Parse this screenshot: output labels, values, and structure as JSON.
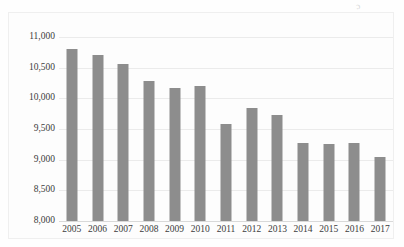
{
  "artifact": {
    "mark": "ɔ"
  },
  "chart_data": {
    "type": "bar",
    "title": "",
    "subtitle": "",
    "xlabel": "",
    "ylabel": "",
    "categories": [
      "2005",
      "2006",
      "2007",
      "2008",
      "2009",
      "2010",
      "2011",
      "2012",
      "2013",
      "2014",
      "2015",
      "2016",
      "2017"
    ],
    "values": [
      10800,
      10700,
      10560,
      10280,
      10170,
      10200,
      9580,
      9840,
      9730,
      9280,
      9250,
      9270,
      9050
    ],
    "series": [
      {
        "name": "",
        "values": [
          10800,
          10700,
          10560,
          10280,
          10170,
          10200,
          9580,
          9840,
          9730,
          9280,
          9250,
          9270,
          9050
        ]
      }
    ],
    "ylim": [
      8000,
      11000
    ],
    "ytick_step": 500,
    "ytick_labels": [
      "11,000",
      "10,500",
      "10,000",
      "9,500",
      "9,000",
      "8,500",
      "8,000"
    ],
    "ytick_values": [
      11000,
      10500,
      10000,
      9500,
      9000,
      8500,
      8000
    ],
    "grid": true,
    "legend": false,
    "legend_position": "none",
    "bar_color": "#8d8d8d",
    "gridline_color": "#ebebeb",
    "axis_text_color": "#3c3c3c",
    "background_color": "#fdfdfd",
    "annotations": []
  }
}
